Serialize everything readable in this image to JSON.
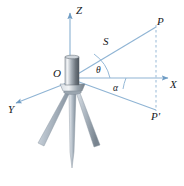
{
  "figure": {
    "background_color": "#ffffff",
    "line_color": "#8fb4d4",
    "label_color": "#15181c",
    "instrument_color": "#9aa6b0",
    "width": 184,
    "height": 186
  },
  "axes": [
    {
      "name": "z-axis",
      "label": "Z",
      "direction": "up"
    },
    {
      "name": "x-axis",
      "label": "X",
      "direction": "right"
    },
    {
      "name": "y-axis",
      "label": "Y",
      "direction": "lower-left"
    }
  ],
  "points": [
    {
      "name": "origin",
      "label": "O",
      "x": 70,
      "y": 78
    },
    {
      "name": "point-p",
      "label": "P",
      "x": 158,
      "y": 24
    },
    {
      "name": "point-p-prime",
      "label": "P'",
      "x": 157,
      "y": 112
    }
  ],
  "segments": [
    {
      "name": "slant-range",
      "label": "S",
      "from": "O",
      "to": "P",
      "style": "solid"
    },
    {
      "name": "ground-line",
      "label": "",
      "from": "O",
      "to": "P'",
      "style": "solid"
    },
    {
      "name": "vertical-drop",
      "label": "",
      "from": "P",
      "to": "P'",
      "style": "dashed"
    }
  ],
  "angles": [
    {
      "name": "theta",
      "label": "θ",
      "between": "S and X-axis"
    },
    {
      "name": "alpha",
      "label": "α",
      "between": "X-axis and OP'"
    }
  ],
  "instrument": {
    "name": "surveying-instrument",
    "parts": [
      "cylinder-body",
      "base-flange",
      "tripod-leg-left",
      "tripod-leg-center",
      "tripod-leg-right"
    ]
  }
}
